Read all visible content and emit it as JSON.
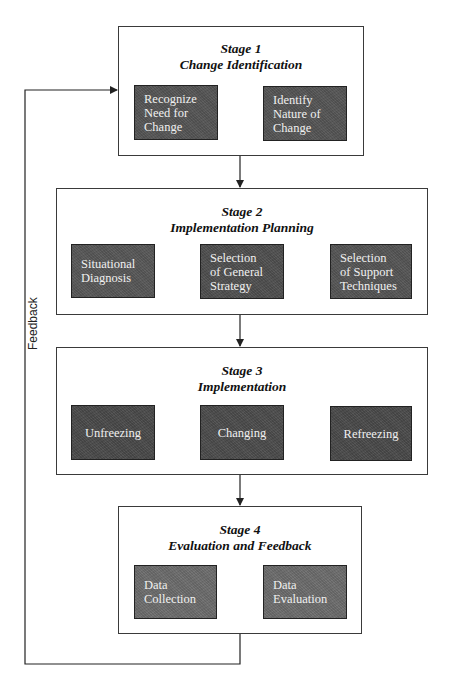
{
  "colors": {
    "stage1_step": "#555555",
    "stage2_step": "#555555",
    "stage3_step": "#4a4a4a",
    "stage4_step": "#6c6c6c",
    "line": "#222222"
  },
  "feedback_label": "Feedback",
  "stages": [
    {
      "title_line1": "Stage 1",
      "title_line2": "Change Identification",
      "steps": [
        {
          "label": "Recognize\nNeed for\nChange"
        },
        {
          "label": "Identify\nNature of\nChange"
        }
      ]
    },
    {
      "title_line1": "Stage 2",
      "title_line2": "Implementation Planning",
      "steps": [
        {
          "label": "Situational\nDiagnosis"
        },
        {
          "label": "Selection\nof General\nStrategy"
        },
        {
          "label": "Selection\nof Support\nTechniques"
        }
      ]
    },
    {
      "title_line1": "Stage 3",
      "title_line2": "Implementation",
      "steps": [
        {
          "label": "Unfreezing"
        },
        {
          "label": "Changing"
        },
        {
          "label": "Refreezing"
        }
      ]
    },
    {
      "title_line1": "Stage 4",
      "title_line2": "Evaluation and Feedback",
      "steps": [
        {
          "label": "Data\nCollection"
        },
        {
          "label": "Data\nEvaluation"
        }
      ]
    }
  ]
}
